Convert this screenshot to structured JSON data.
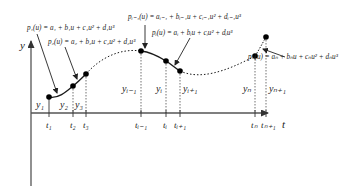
{
  "diagram": {
    "type": "piecewise cubic spline interpolation",
    "axes": {
      "x_label": "t",
      "y_label": "y"
    },
    "equations": {
      "p1": "p₁(u) = a₁ + b₁u + c₁u² + d₁u³",
      "p2": "p₂(u) = a₂ + b₂u + c₂u² + d₂u³",
      "pi_minus_1": "pᵢ₋₁(u) = aᵢ₋₁ + bᵢ₋₁u + cᵢ₋₁u² + dᵢ₋₁u³",
      "pi": "pᵢ(u) = aᵢ + bᵢu + cᵢu² + dᵢu³",
      "pn": "pₙ(u) = aₙ + bₙu + cₙu² + dₙu³"
    },
    "points": [
      {
        "y_label": "y₁",
        "t_label": "t₁"
      },
      {
        "y_label": "y₂",
        "t_label": "t₂"
      },
      {
        "y_label": "y₃",
        "t_label": "t₃"
      },
      {
        "y_label": "yᵢ₋₁",
        "t_label": "tᵢ₋₁"
      },
      {
        "y_label": "yᵢ",
        "t_label": "tᵢ"
      },
      {
        "y_label": "yᵢ₊₁",
        "t_label": "tᵢ₊₁"
      },
      {
        "y_label": "yₙ",
        "t_label": "tₙ"
      },
      {
        "y_label": "yₙ₊₁",
        "t_label": "tₙ₊₁"
      }
    ],
    "colors": {
      "line": "#1a1a1a",
      "axis": "#555555",
      "dot": "#000000"
    }
  }
}
